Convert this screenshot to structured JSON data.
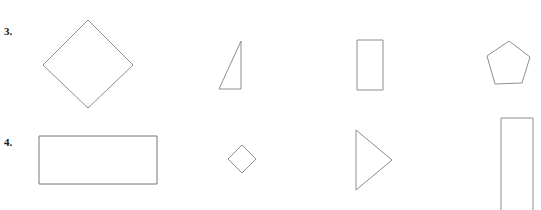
{
  "page": {
    "background_color": "#ffffff",
    "stroke_color": "#8e8e8e",
    "text_color": "#1a1a1a",
    "width": 541,
    "height": 210
  },
  "rows": [
    {
      "label": "3.",
      "shapes": [
        {
          "name": "rhombus",
          "label": "diamond"
        },
        {
          "name": "right-triangle",
          "label": "right triangle"
        },
        {
          "name": "rectangle-vertical",
          "label": "rectangle"
        },
        {
          "name": "pentagon",
          "label": "pentagon"
        }
      ]
    },
    {
      "label": "4.",
      "shapes": [
        {
          "name": "rectangle-wide",
          "label": "wide rectangle"
        },
        {
          "name": "rhombus-small",
          "label": "small diamond"
        },
        {
          "name": "triangle-right-pointing",
          "label": "right-pointing triangle"
        },
        {
          "name": "rectangle-tall",
          "label": "tall rectangle"
        }
      ]
    }
  ]
}
